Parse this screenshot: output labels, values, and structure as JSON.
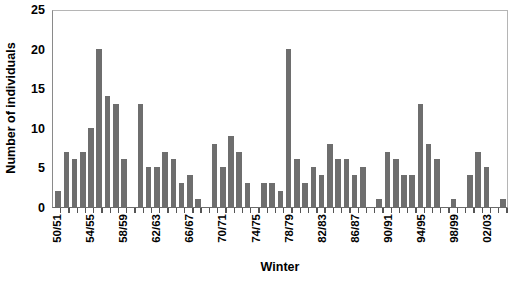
{
  "chart_data": {
    "type": "bar",
    "title": "",
    "xlabel": "Winter",
    "ylabel": "Number of individuals",
    "ylim": [
      0,
      25
    ],
    "yticks": [
      0,
      5,
      10,
      15,
      20,
      25
    ],
    "grid": false,
    "legend": null,
    "bar_color": "#6e6e6e",
    "axis_color": "#6b6b6b",
    "categories": [
      "50/51",
      "51/52",
      "52/53",
      "53/54",
      "54/55",
      "55/56",
      "56/57",
      "57/58",
      "58/59",
      "59/60",
      "60/61",
      "61/62",
      "62/63",
      "63/64",
      "64/65",
      "65/66",
      "66/67",
      "67/68",
      "68/69",
      "69/70",
      "70/71",
      "71/72",
      "72/73",
      "73/74",
      "74/75",
      "75/76",
      "76/77",
      "77/78",
      "78/79",
      "79/80",
      "80/81",
      "81/82",
      "82/83",
      "83/84",
      "84/85",
      "85/86",
      "86/87",
      "87/88",
      "88/89",
      "89/90",
      "90/91",
      "91/92",
      "92/93",
      "93/94",
      "94/95",
      "95/96",
      "96/97",
      "97/98",
      "98/99",
      "99/00",
      "00/01",
      "01/02",
      "02/03",
      "03/04",
      "04/05"
    ],
    "values": [
      2,
      7,
      6,
      7,
      10,
      20,
      14,
      13,
      6,
      0,
      13,
      5,
      5,
      7,
      6,
      3,
      4,
      1,
      0,
      8,
      5,
      9,
      7,
      3,
      0,
      3,
      3,
      2,
      20,
      6,
      3,
      5,
      4,
      8,
      6,
      6,
      4,
      5,
      0,
      1,
      7,
      6,
      4,
      4,
      13,
      8,
      6,
      0,
      1,
      0,
      4,
      7,
      5,
      0,
      1
    ],
    "labeled_ticks": [
      "50/51",
      "54/55",
      "58/59",
      "62/63",
      "66/67",
      "70/71",
      "74/75",
      "78/79",
      "82/83",
      "86/87",
      "90/91",
      "94/95",
      "98/99",
      "02/03"
    ]
  }
}
